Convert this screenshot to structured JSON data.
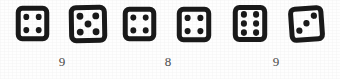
{
  "figure": {
    "background_color": "#fefefe",
    "ink_color": "#1a1a1a",
    "label_color": "#4a4a4a"
  },
  "chart_data": {
    "type": "table",
    "title": "",
    "subtitle": "",
    "xlabel": "",
    "ylabel": "",
    "categories": [
      "pair-1",
      "pair-2",
      "pair-3"
    ],
    "values": [
      9,
      8,
      9
    ],
    "dice_faces": [
      4,
      5,
      4,
      4,
      6,
      3
    ],
    "pairs": [
      {
        "dice": [
          4,
          5
        ],
        "sum": 9,
        "sum_text": "9"
      },
      {
        "dice": [
          4,
          4
        ],
        "sum": 8,
        "sum_text": "8"
      },
      {
        "dice": [
          6,
          3
        ],
        "sum": 9,
        "sum_text": "9"
      }
    ],
    "legend": [],
    "grid": false
  },
  "dice": [
    {
      "index": 1,
      "face_value": 4,
      "face_text": "4",
      "pip_count": 4,
      "layout": "four-corners",
      "rotation_deg": 0,
      "x": 17,
      "y": 7,
      "w": 31,
      "h": 33,
      "pips": [
        [
          0.3,
          0.3
        ],
        [
          0.7,
          0.3
        ],
        [
          0.3,
          0.7
        ],
        [
          0.7,
          0.7
        ]
      ]
    },
    {
      "index": 2,
      "face_value": 5,
      "face_text": "5",
      "pip_count": 5,
      "layout": "quincunx",
      "rotation_deg": -1,
      "x": 70,
      "y": 6,
      "w": 36,
      "h": 36,
      "pips": [
        [
          0.28,
          0.28
        ],
        [
          0.72,
          0.28
        ],
        [
          0.5,
          0.5
        ],
        [
          0.28,
          0.72
        ],
        [
          0.72,
          0.72
        ]
      ]
    },
    {
      "index": 3,
      "face_value": 4,
      "face_text": "4",
      "pip_count": 4,
      "layout": "four-corners",
      "rotation_deg": 0,
      "x": 124,
      "y": 8,
      "w": 31,
      "h": 32,
      "pips": [
        [
          0.3,
          0.3
        ],
        [
          0.7,
          0.3
        ],
        [
          0.3,
          0.7
        ],
        [
          0.7,
          0.7
        ]
      ]
    },
    {
      "index": 4,
      "face_value": 4,
      "face_text": "4",
      "pip_count": 4,
      "layout": "four-corners",
      "rotation_deg": 0,
      "x": 178,
      "y": 8,
      "w": 32,
      "h": 33,
      "pips": [
        [
          0.3,
          0.3
        ],
        [
          0.7,
          0.3
        ],
        [
          0.3,
          0.7
        ],
        [
          0.7,
          0.7
        ]
      ]
    },
    {
      "index": 5,
      "face_value": 6,
      "face_text": "6",
      "pip_count": 6,
      "layout": "two-columns-of-three",
      "rotation_deg": 0,
      "x": 234,
      "y": 6,
      "w": 32,
      "h": 35,
      "pips": [
        [
          0.31,
          0.24
        ],
        [
          0.69,
          0.24
        ],
        [
          0.31,
          0.5
        ],
        [
          0.69,
          0.5
        ],
        [
          0.31,
          0.76
        ],
        [
          0.69,
          0.76
        ]
      ]
    },
    {
      "index": 6,
      "face_value": 3,
      "face_text": "3",
      "pip_count": 3,
      "layout": "diagonal-ascending",
      "rotation_deg": -4,
      "x": 290,
      "y": 7,
      "w": 33,
      "h": 34,
      "pips": [
        [
          0.27,
          0.68
        ],
        [
          0.5,
          0.48
        ],
        [
          0.74,
          0.27
        ]
      ]
    }
  ],
  "sum_labels": [
    {
      "index": 1,
      "text": "9",
      "x": 62,
      "y": 61
    },
    {
      "index": 2,
      "text": "8",
      "x": 168,
      "y": 61
    },
    {
      "index": 3,
      "text": "9",
      "x": 276,
      "y": 61
    }
  ]
}
